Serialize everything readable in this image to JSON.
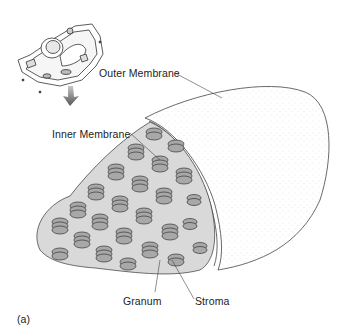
{
  "figure": {
    "panel_label": "(a)",
    "labels": {
      "outer_membrane": "Outer Membrane",
      "inner_membrane": "Inner Membrane",
      "granum": "Granum",
      "stroma": "Stroma"
    },
    "colors": {
      "background": "#ffffff",
      "line": "#333333",
      "granum_fill": "#a8a8a8",
      "arrow": "#6a6a6a",
      "stipple": "#9a9a9a"
    }
  }
}
